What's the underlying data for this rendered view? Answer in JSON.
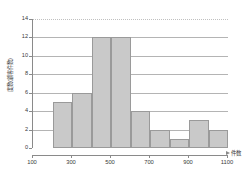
{
  "chart_data": {
    "type": "bar",
    "title": "",
    "subtitle": "",
    "xlabel": "件数",
    "ylabel": "度数(顧客件数)",
    "grid": true,
    "legend": "none",
    "xlim": [
      100,
      1100
    ],
    "ylim": [
      0,
      14
    ],
    "bin_width": 100,
    "x_ticks": [
      100,
      300,
      500,
      700,
      900,
      1100
    ],
    "x_tick_labels": [
      "100",
      "300",
      "500",
      "700",
      "900",
      "1100"
    ],
    "y_ticks": [
      0,
      2,
      4,
      6,
      8,
      10,
      12,
      14
    ],
    "y_tick_labels": [
      "0",
      "2",
      "4",
      "6",
      "8",
      "10",
      "12",
      "14"
    ],
    "bins": [
      {
        "start": 200,
        "end": 300,
        "label": "200-300",
        "value": 5
      },
      {
        "start": 300,
        "end": 400,
        "label": "300-400",
        "value": 6
      },
      {
        "start": 400,
        "end": 500,
        "label": "400-500",
        "value": 12
      },
      {
        "start": 500,
        "end": 600,
        "label": "500-600",
        "value": 12
      },
      {
        "start": 600,
        "end": 700,
        "label": "600-700",
        "value": 4
      },
      {
        "start": 700,
        "end": 800,
        "label": "700-800",
        "value": 2
      },
      {
        "start": 800,
        "end": 900,
        "label": "800-900",
        "value": 1
      },
      {
        "start": 900,
        "end": 1000,
        "label": "900-1000",
        "value": 3
      },
      {
        "start": 1000,
        "end": 1100,
        "label": "1000-1100",
        "value": 2
      }
    ],
    "categories": [
      "200-300",
      "300-400",
      "400-500",
      "500-600",
      "600-700",
      "700-800",
      "800-900",
      "900-1000",
      "1000-1100"
    ],
    "values": [
      5,
      6,
      12,
      12,
      4,
      2,
      1,
      3,
      2
    ],
    "colors": {
      "bar_fill": "#c9c9c9",
      "bar_stroke": "#9a9a9a",
      "axis": "#8a8a8a",
      "gridline": "#b4b4b4",
      "gridline_top": "#c0c0c0",
      "text": "#3a3a3a",
      "background": "#ffffff"
    }
  }
}
